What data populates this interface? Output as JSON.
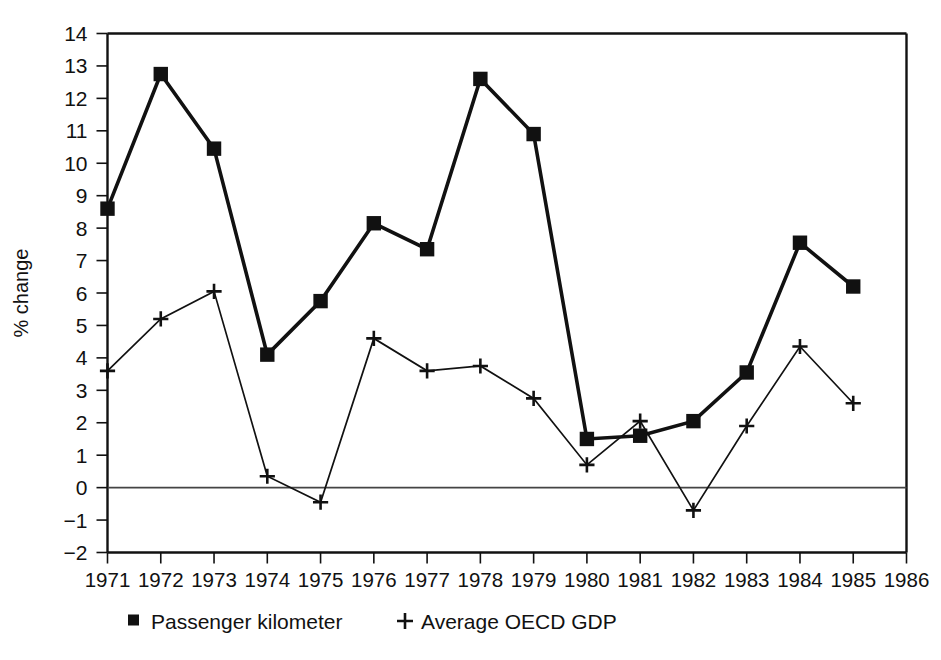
{
  "chart_data": {
    "type": "line",
    "title": "",
    "subtitle": "",
    "xlabel": "",
    "ylabel": "% change",
    "xlim": [
      1971,
      1986
    ],
    "ylim": [
      -2,
      14
    ],
    "grid": false,
    "legend_position": "bottom",
    "x": [
      1971,
      1972,
      1973,
      1974,
      1975,
      1976,
      1977,
      1978,
      1979,
      1980,
      1981,
      1982,
      1983,
      1984,
      1985
    ],
    "xticks": [
      "1971",
      "1972",
      "1973",
      "1974",
      "1975",
      "1976",
      "1977",
      "1978",
      "1979",
      "1980",
      "1981",
      "1982",
      "1983",
      "1984",
      "1985",
      "1986"
    ],
    "yticks": [
      "14",
      "13",
      "12",
      "11",
      "10",
      "9",
      "8",
      "7",
      "6",
      "5",
      "4",
      "3",
      "2",
      "1",
      "0",
      "−1",
      "−2"
    ],
    "ytick_values": [
      14,
      13,
      12,
      11,
      10,
      9,
      8,
      7,
      6,
      5,
      4,
      3,
      2,
      1,
      0,
      -1,
      -2
    ],
    "series": [
      {
        "name": "Passenger kilometer",
        "marker": "square",
        "line_width": "thick",
        "values": [
          8.6,
          12.75,
          10.45,
          4.1,
          5.75,
          8.15,
          7.35,
          12.6,
          10.9,
          1.5,
          1.6,
          2.05,
          3.55,
          7.55,
          6.2
        ]
      },
      {
        "name": "Average OECD GDP",
        "marker": "plus",
        "line_width": "thin",
        "values": [
          3.6,
          5.2,
          6.05,
          0.35,
          -0.45,
          4.6,
          3.6,
          3.75,
          2.75,
          0.7,
          2.05,
          -0.7,
          1.9,
          4.35,
          2.6
        ]
      }
    ]
  },
  "legend": {
    "items": [
      {
        "label": "Passenger kilometer",
        "marker": "square-marker-icon"
      },
      {
        "label": "Average OECD GDP",
        "marker": "plus-marker-icon"
      }
    ]
  },
  "colors": {
    "ink": "#111111",
    "background": "#ffffff",
    "zero_line": "#444444"
  }
}
